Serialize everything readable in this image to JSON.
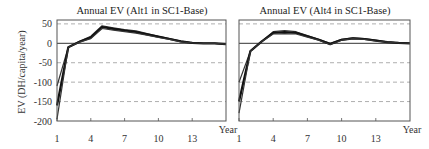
{
  "chart_data": [
    {
      "type": "line",
      "title": "Annual EV (Alt1 in SC1-Base)",
      "xlabel": "Year",
      "ylabel": "EV (DH/capita/year)",
      "xticks": [
        1,
        4,
        7,
        10,
        13
      ],
      "yticks": [
        50,
        0,
        -50,
        -100,
        -150,
        -200
      ],
      "xlim": [
        1,
        16
      ],
      "ylim": [
        -200,
        60
      ],
      "grid": "horizontal dashed",
      "x": [
        1,
        2,
        3,
        4,
        5,
        6,
        7,
        8,
        9,
        10,
        11,
        12,
        13,
        14,
        15,
        16
      ],
      "series": [
        {
          "name": "upper envelope",
          "values": [
            -110,
            -10,
            5,
            18,
            45,
            40,
            35,
            32,
            25,
            18,
            12,
            6,
            1,
            0,
            0,
            -2
          ]
        },
        {
          "name": "central",
          "values": [
            -160,
            -10,
            4,
            15,
            42,
            37,
            33,
            29,
            23,
            17,
            11,
            5,
            1,
            0,
            0,
            -2
          ]
        },
        {
          "name": "lower envelope",
          "values": [
            -195,
            -10,
            3,
            12,
            38,
            34,
            30,
            26,
            21,
            15,
            10,
            4,
            1,
            0,
            0,
            -2
          ]
        }
      ]
    },
    {
      "type": "line",
      "title": "Annual EV (Alt4 in SC1-Base)",
      "xlabel": "Year",
      "ylabel": "",
      "xticks": [
        1,
        4,
        7,
        10,
        13
      ],
      "yticks": [
        50,
        0,
        -50,
        -100,
        -150,
        -200
      ],
      "xlim": [
        1,
        16
      ],
      "ylim": [
        -200,
        60
      ],
      "grid": "horizontal dashed",
      "x": [
        1,
        2,
        3,
        4,
        5,
        6,
        7,
        8,
        9,
        10,
        11,
        12,
        13,
        14,
        15,
        16
      ],
      "series": [
        {
          "name": "upper envelope",
          "values": [
            -100,
            -20,
            5,
            30,
            33,
            30,
            20,
            10,
            0,
            10,
            14,
            12,
            8,
            4,
            1,
            0
          ]
        },
        {
          "name": "central",
          "values": [
            -150,
            -20,
            5,
            27,
            29,
            27,
            18,
            9,
            -2,
            9,
            13,
            11,
            7,
            3,
            1,
            0
          ]
        },
        {
          "name": "lower envelope",
          "values": [
            -180,
            -20,
            5,
            24,
            25,
            24,
            16,
            8,
            -3,
            8,
            12,
            10,
            6,
            3,
            1,
            0
          ]
        }
      ]
    }
  ],
  "panels": [
    {
      "title": "Annual EV (Alt1 in SC1-Base)",
      "xlabel": "Year",
      "ylabel": "EV (DH/capita/year)"
    },
    {
      "title": "Annual EV (Alt4 in SC1-Base)",
      "xlabel": "Year"
    }
  ]
}
